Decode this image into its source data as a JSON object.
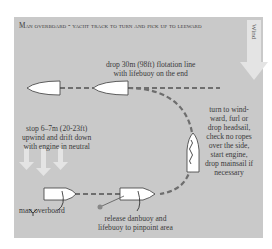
{
  "title": "Man overboard - yacht track to turn and pick up to leeward",
  "wind": {
    "label": "Wind"
  },
  "annotations": {
    "drop_line": [
      "drop 30m (98ft) flotation line",
      "with lifebuoy on the end"
    ],
    "stop_upwind": [
      "stop 6–7m (20-23ft)",
      "upwind and drift down",
      "with engine in neutral"
    ],
    "turn_windward": [
      "turn to wind-",
      "ward, furl or",
      "drop headsail,",
      "check no ropes",
      "over the side,",
      "start engine,",
      "drop mainsail if",
      "necessary"
    ],
    "man_overboard": "man overboard",
    "release_danbuoy": [
      "release danbuoy and",
      "lifebuoy to pinpoint area"
    ]
  },
  "colors": {
    "panel": "#c9c9c9",
    "boat_fill": "#ffffff",
    "outline": "#3a3a3a",
    "track": "#6e6e6e",
    "arrow": "#e4e4e4"
  }
}
